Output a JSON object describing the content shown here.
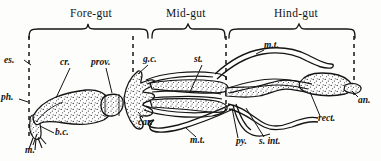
{
  "figure": {
    "type": "anatomical-diagram",
    "background_color": "#fdfdfb",
    "ink_color": "#141414"
  },
  "regions": [
    {
      "id": "fore-gut",
      "label": "Fore-gut",
      "x": 88,
      "y": 14,
      "brace": {
        "x1": 28,
        "x2": 148,
        "y": 28,
        "depth": 9
      }
    },
    {
      "id": "mid-gut",
      "label": "Mid-gut",
      "x": 188,
      "y": 14,
      "brace": {
        "x1": 152,
        "x2": 225,
        "y": 28,
        "depth": 9
      }
    },
    {
      "id": "hind-gut",
      "label": "Hind-gut",
      "x": 300,
      "y": 14,
      "brace": {
        "x1": 229,
        "x2": 357,
        "y": 28,
        "depth": 9
      }
    }
  ],
  "dividers": [
    {
      "id": "divider-left",
      "x": 29,
      "y1": 36,
      "y2": 140
    },
    {
      "id": "divider-fore-mid",
      "x": 133,
      "y1": 36,
      "y2": 112
    },
    {
      "id": "divider-mid-hind",
      "x": 226,
      "y1": 36,
      "y2": 108
    },
    {
      "id": "divider-right",
      "x": 353,
      "y1": 36,
      "y2": 96
    }
  ],
  "parts": [
    {
      "id": "es",
      "label": "es.",
      "x": 5,
      "y": 58,
      "name": "oesophagus"
    },
    {
      "id": "ph",
      "label": "ph.",
      "x": 2,
      "y": 96,
      "name": "pharynx"
    },
    {
      "id": "m",
      "label": "m.",
      "x": 27,
      "y": 148,
      "name": "mouth"
    },
    {
      "id": "bc",
      "label": "b.c.",
      "x": 54,
      "y": 137,
      "name": "buccal-cavity"
    },
    {
      "id": "cr",
      "label": "cr.",
      "x": 62,
      "y": 60,
      "name": "crop"
    },
    {
      "id": "prov",
      "label": "prov.",
      "x": 94,
      "y": 60,
      "name": "proventriculus"
    },
    {
      "id": "gc",
      "label": "g.c.",
      "x": 146,
      "y": 57,
      "name": "gastric-caeca"
    },
    {
      "id": "st",
      "label": "st.",
      "x": 196,
      "y": 57,
      "name": "stomach"
    },
    {
      "id": "car",
      "label": "car.",
      "x": 140,
      "y": 120,
      "name": "cardiac-valve"
    },
    {
      "id": "mt-top",
      "label": "m.t.",
      "x": 266,
      "y": 43,
      "name": "malpighian-tubule-upper"
    },
    {
      "id": "mt-bot",
      "label": "m.t.",
      "x": 190,
      "y": 140,
      "name": "malpighian-tubule-lower"
    },
    {
      "id": "py",
      "label": "py.",
      "x": 240,
      "y": 142,
      "name": "pylorus"
    },
    {
      "id": "sint",
      "label": "s. int.",
      "x": 262,
      "y": 142,
      "name": "small-intestine"
    },
    {
      "id": "rect",
      "label": "rect.",
      "x": 320,
      "y": 119,
      "name": "rectum"
    },
    {
      "id": "an",
      "label": "an.",
      "x": 358,
      "y": 100,
      "name": "anus"
    }
  ]
}
